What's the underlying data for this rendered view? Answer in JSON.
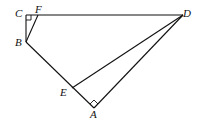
{
  "diagram": {
    "type": "geometry",
    "points": {
      "C": {
        "label": "C",
        "x": 26,
        "y": 15
      },
      "F": {
        "label": "F",
        "x": 38,
        "y": 15
      },
      "D": {
        "label": "D",
        "x": 183,
        "y": 15
      },
      "B": {
        "label": "B",
        "x": 26,
        "y": 42
      },
      "E": {
        "label": "E",
        "x": 72,
        "y": 88
      },
      "A": {
        "label": "A",
        "x": 94,
        "y": 108
      }
    },
    "segments": [
      "CD",
      "CB",
      "BF",
      "BA",
      "AD",
      "ED"
    ],
    "right_angles": [
      "C",
      "A"
    ],
    "labels": {
      "C": "C",
      "F": "F",
      "D": "D",
      "B": "B",
      "E": "E",
      "A": "A"
    }
  }
}
